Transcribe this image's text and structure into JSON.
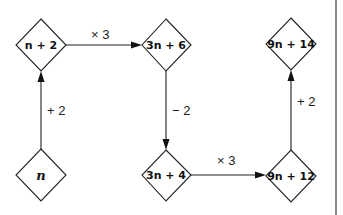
{
  "diagram": {
    "title": "",
    "nodes": [
      {
        "id": "n",
        "label": "n",
        "cx": 41,
        "cy": 175
      },
      {
        "id": "n_plus_2",
        "label": "n + 2",
        "cx": 41,
        "cy": 45
      },
      {
        "id": "3n_plus_6",
        "label": "3n + 6",
        "cx": 166,
        "cy": 45
      },
      {
        "id": "3n_plus_4",
        "label": "3n + 4",
        "cx": 166,
        "cy": 175
      },
      {
        "id": "9n_plus_12",
        "label": "9n + 12",
        "cx": 291,
        "cy": 176
      },
      {
        "id": "9n_plus_14",
        "label": "9n + 14",
        "cx": 291,
        "cy": 44
      }
    ],
    "edges": [
      {
        "from": "n",
        "to": "n_plus_2",
        "label": "+ 2"
      },
      {
        "from": "n_plus_2",
        "to": "3n_plus_6",
        "label": "× 3"
      },
      {
        "from": "3n_plus_6",
        "to": "3n_plus_4",
        "label": "− 2"
      },
      {
        "from": "3n_plus_4",
        "to": "9n_plus_12",
        "label": "× 3"
      },
      {
        "from": "9n_plus_12",
        "to": "9n_plus_14",
        "label": "+ 2"
      }
    ],
    "colors": {
      "stroke": "#222222",
      "side_rule": "#8a8a8a",
      "background": "#ffffff"
    }
  }
}
